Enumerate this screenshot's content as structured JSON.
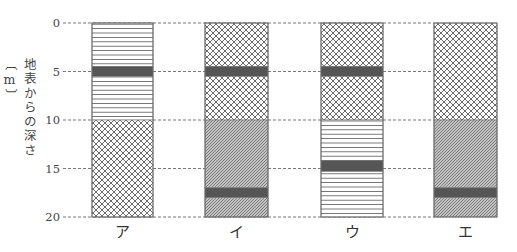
{
  "diagram": {
    "type": "stratigraphic-columns",
    "axis": {
      "title": "地表からの深さ〔m〕",
      "unit": "m",
      "range": [
        0,
        20
      ],
      "ticks": [
        {
          "value": 0,
          "label": "0"
        },
        {
          "value": 5,
          "label": "5"
        },
        {
          "value": 10,
          "label": "10"
        },
        {
          "value": 15,
          "label": "15"
        },
        {
          "value": 20,
          "label": "20"
        }
      ]
    },
    "columns": [
      {
        "label": "ア",
        "layers": [
          {
            "top": 0,
            "bottom": 4.5,
            "pattern": "horizontal-lines"
          },
          {
            "top": 4.5,
            "bottom": 5.5,
            "pattern": "solid-dark"
          },
          {
            "top": 5.5,
            "bottom": 10,
            "pattern": "horizontal-lines"
          },
          {
            "top": 10,
            "bottom": 20,
            "pattern": "cross-hatch"
          }
        ]
      },
      {
        "label": "イ",
        "layers": [
          {
            "top": 0,
            "bottom": 4.5,
            "pattern": "cross-hatch"
          },
          {
            "top": 4.5,
            "bottom": 5.5,
            "pattern": "solid-dark"
          },
          {
            "top": 5.5,
            "bottom": 10,
            "pattern": "cross-hatch"
          },
          {
            "top": 10,
            "bottom": 17,
            "pattern": "diagonal-hatch"
          },
          {
            "top": 17,
            "bottom": 18,
            "pattern": "solid-dark"
          },
          {
            "top": 18,
            "bottom": 20,
            "pattern": "diagonal-hatch"
          }
        ]
      },
      {
        "label": "ウ",
        "layers": [
          {
            "top": 0,
            "bottom": 4.5,
            "pattern": "cross-hatch"
          },
          {
            "top": 4.5,
            "bottom": 5.5,
            "pattern": "solid-dark"
          },
          {
            "top": 5.5,
            "bottom": 10,
            "pattern": "cross-hatch"
          },
          {
            "top": 10,
            "bottom": 14.2,
            "pattern": "horizontal-lines"
          },
          {
            "top": 14.2,
            "bottom": 15.3,
            "pattern": "solid-dark"
          },
          {
            "top": 15.3,
            "bottom": 20,
            "pattern": "horizontal-lines"
          }
        ]
      },
      {
        "label": "エ",
        "layers": [
          {
            "top": 0,
            "bottom": 10,
            "pattern": "cross-hatch"
          },
          {
            "top": 10,
            "bottom": 17,
            "pattern": "diagonal-hatch"
          },
          {
            "top": 17,
            "bottom": 18,
            "pattern": "solid-dark"
          },
          {
            "top": 18,
            "bottom": 20,
            "pattern": "diagonal-hatch"
          }
        ]
      }
    ],
    "colors": {
      "background": "#ffffff",
      "line": "#666666",
      "dark_band": "#555555",
      "diagonal_fill": "#c4c4c4"
    }
  }
}
